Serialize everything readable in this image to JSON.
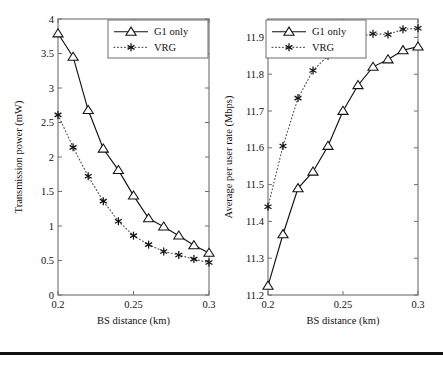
{
  "figure": {
    "background_color": "#ffffff",
    "line_color": "#111111",
    "axis_color": "#6e6e6e",
    "panel_count": 2,
    "bottom_rule": true
  },
  "legend": {
    "entries": [
      {
        "label": "G1 only",
        "marker": "triangle-up-marker",
        "line_style": "solid"
      },
      {
        "label": "VRG",
        "marker": "asterisk-marker",
        "line_style": "dotted"
      }
    ],
    "position": "upper-right"
  },
  "chart_data": [
    {
      "id": "transmission-power-chart",
      "type": "line",
      "title": "",
      "xlabel": "BS distance (km)",
      "ylabel": "Transmission power (mW)",
      "x": [
        0.2,
        0.21,
        0.22,
        0.23,
        0.24,
        0.25,
        0.26,
        0.27,
        0.28,
        0.29,
        0.3
      ],
      "xlim": [
        0.2,
        0.3
      ],
      "ylim": [
        0,
        4
      ],
      "xticks": [
        0.2,
        0.25,
        0.3
      ],
      "xticklabels": [
        "0.2",
        "0.25",
        "0.3"
      ],
      "yticks": [
        0,
        0.5,
        1,
        1.5,
        2,
        2.5,
        3,
        3.5,
        4
      ],
      "yticklabels": [
        "0",
        "0.5",
        "1",
        "1.5",
        "2",
        "2.5",
        "3",
        "3.5",
        "4"
      ],
      "grid": false,
      "legend_position": "upper-right",
      "series": [
        {
          "name": "G1 only",
          "marker": "triangle-up-marker",
          "line_style": "solid",
          "color": "#111111",
          "values": [
            3.79,
            3.45,
            2.68,
            2.12,
            1.81,
            1.44,
            1.11,
            0.99,
            0.86,
            0.72,
            0.61
          ]
        },
        {
          "name": "VRG",
          "marker": "asterisk-marker",
          "line_style": "dotted",
          "color": "#111111",
          "values": [
            2.61,
            2.14,
            1.72,
            1.36,
            1.07,
            0.86,
            0.73,
            0.63,
            0.58,
            0.52,
            0.47
          ]
        }
      ]
    },
    {
      "id": "average-per-user-rate-chart",
      "type": "line",
      "title": "",
      "xlabel": "BS distance (km)",
      "ylabel": "Average per user rate (Mbps)",
      "x": [
        0.2,
        0.21,
        0.22,
        0.23,
        0.24,
        0.25,
        0.26,
        0.27,
        0.28,
        0.29,
        0.3
      ],
      "xlim": [
        0.2,
        0.3
      ],
      "ylim": [
        11.2,
        11.95
      ],
      "xticks": [
        0.2,
        0.25,
        0.3
      ],
      "xticklabels": [
        "0.2",
        "0.25",
        "0.3"
      ],
      "yticks": [
        11.2,
        11.3,
        11.4,
        11.5,
        11.6,
        11.7,
        11.8,
        11.9
      ],
      "yticklabels": [
        "11.2",
        "11.3",
        "11.4",
        "11.5",
        "11.6",
        "11.7",
        "11.8",
        "11.9"
      ],
      "grid": false,
      "legend_position": "upper-left",
      "series": [
        {
          "name": "G1 only",
          "marker": "triangle-up-marker",
          "line_style": "solid",
          "color": "#111111",
          "values": [
            11.225,
            11.365,
            11.49,
            11.535,
            11.605,
            11.7,
            11.77,
            11.82,
            11.84,
            11.865,
            11.875
          ]
        },
        {
          "name": "VRG",
          "marker": "asterisk-marker",
          "line_style": "dotted",
          "color": "#111111",
          "values": [
            11.44,
            11.605,
            11.735,
            11.81,
            11.85,
            11.862,
            11.902,
            11.91,
            11.908,
            11.922,
            11.925
          ]
        }
      ]
    }
  ]
}
